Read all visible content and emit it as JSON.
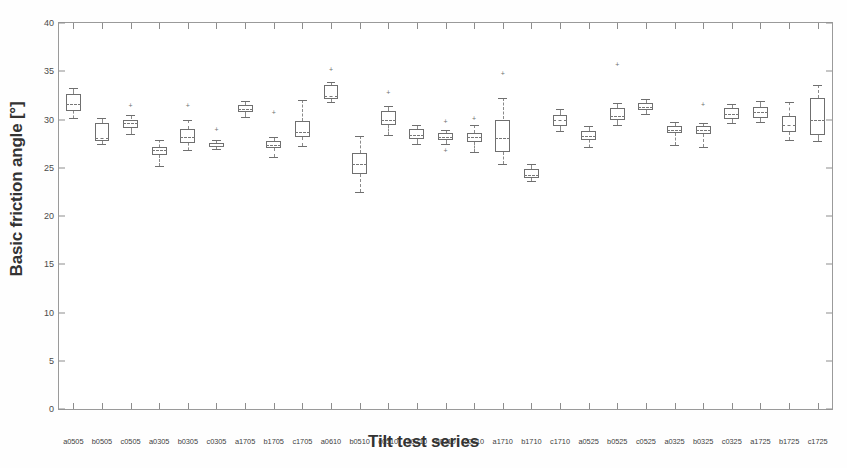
{
  "chart_data": {
    "type": "box",
    "title": "",
    "xlabel": "Tilt test series",
    "ylabel": "Basic friction angle [°]",
    "ylim": [
      0,
      40
    ],
    "ytick_labels": [
      "0",
      "5",
      "10",
      "15",
      "20",
      "25",
      "30",
      "35",
      "40"
    ],
    "yticks": [
      0,
      5,
      10,
      15,
      20,
      25,
      30,
      35,
      40
    ],
    "grid": false,
    "legend": null,
    "categories": [
      "a0505",
      "b0505",
      "c0505",
      "a0305",
      "b0305",
      "c0305",
      "a1705",
      "b1705",
      "c1705",
      "a0510",
      "b0510",
      "c0510",
      "a0310",
      "b0310",
      "c0310",
      "a1710",
      "b1710",
      "c1710",
      "a0525",
      "b0525",
      "c0525",
      "a0325",
      "b0325",
      "c0325",
      "a1725",
      "b1725",
      "c1725"
    ],
    "boxes": [
      {
        "label": "a0505",
        "whisker_low": 30.2,
        "q1": 30.9,
        "median": 31.6,
        "q3": 32.6,
        "whisker_high": 33.3,
        "outliers": []
      },
      {
        "label": "b0505",
        "whisker_low": 27.5,
        "q1": 27.8,
        "median": 28.1,
        "q3": 29.6,
        "whisker_high": 30.2,
        "outliers": []
      },
      {
        "label": "c0505",
        "whisker_low": 28.5,
        "q1": 29.1,
        "median": 29.6,
        "q3": 30.0,
        "whisker_high": 30.5,
        "outliers": [
          31.5
        ]
      },
      {
        "label": "a0305",
        "whisker_low": 25.2,
        "q1": 26.3,
        "median": 26.8,
        "q3": 27.2,
        "whisker_high": 27.9,
        "outliers": []
      },
      {
        "label": "b0305",
        "whisker_low": 26.8,
        "q1": 27.6,
        "median": 28.2,
        "q3": 29.0,
        "whisker_high": 29.9,
        "outliers": [
          31.5
        ]
      },
      {
        "label": "c0305",
        "whisker_low": 26.9,
        "q1": 27.1,
        "median": 27.3,
        "q3": 27.6,
        "whisker_high": 27.9,
        "outliers": [
          29.0
        ]
      },
      {
        "label": "a1705",
        "whisker_low": 30.3,
        "q1": 30.8,
        "median": 31.1,
        "q3": 31.5,
        "whisker_high": 31.9,
        "outliers": []
      },
      {
        "label": "b1705",
        "whisker_low": 26.1,
        "q1": 27.0,
        "median": 27.4,
        "q3": 27.8,
        "whisker_high": 28.2,
        "outliers": [
          30.8
        ]
      },
      {
        "label": "c1705",
        "whisker_low": 27.3,
        "q1": 28.2,
        "median": 28.7,
        "q3": 29.8,
        "whisker_high": 32.0,
        "outliers": []
      },
      {
        "label": "a0610",
        "whisker_low": 31.8,
        "q1": 32.1,
        "median": 32.4,
        "q3": 33.6,
        "whisker_high": 33.9,
        "outliers": [
          35.2
        ]
      },
      {
        "label": "b0510",
        "whisker_low": 22.5,
        "q1": 24.4,
        "median": 25.4,
        "q3": 26.5,
        "whisker_high": 28.3,
        "outliers": []
      },
      {
        "label": "c0510",
        "whisker_low": 28.4,
        "q1": 29.4,
        "median": 30.0,
        "q3": 30.9,
        "whisker_high": 31.4,
        "outliers": [
          32.8
        ]
      },
      {
        "label": "a0310",
        "whisker_low": 27.5,
        "q1": 28.0,
        "median": 28.4,
        "q3": 29.0,
        "whisker_high": 29.4,
        "outliers": []
      },
      {
        "label": "b0310",
        "whisker_low": 27.5,
        "q1": 27.9,
        "median": 28.2,
        "q3": 28.6,
        "whisker_high": 28.9,
        "outliers": [
          26.8,
          29.8
        ]
      },
      {
        "label": "c0310",
        "whisker_low": 26.6,
        "q1": 27.7,
        "median": 28.2,
        "q3": 28.6,
        "whisker_high": 29.4,
        "outliers": [
          30.2
        ]
      },
      {
        "label": "a1710",
        "whisker_low": 25.4,
        "q1": 26.6,
        "median": 28.1,
        "q3": 30.0,
        "whisker_high": 32.2,
        "outliers": [
          34.8
        ]
      },
      {
        "label": "b1710",
        "whisker_low": 23.6,
        "q1": 23.9,
        "median": 24.3,
        "q3": 24.9,
        "whisker_high": 25.4,
        "outliers": []
      },
      {
        "label": "c1710",
        "whisker_low": 28.8,
        "q1": 29.3,
        "median": 30.0,
        "q3": 30.5,
        "whisker_high": 31.1,
        "outliers": []
      },
      {
        "label": "a0525",
        "whisker_low": 27.1,
        "q1": 27.9,
        "median": 28.3,
        "q3": 28.8,
        "whisker_high": 29.3,
        "outliers": []
      },
      {
        "label": "b0525",
        "whisker_low": 29.4,
        "q1": 29.9,
        "median": 30.4,
        "q3": 31.2,
        "whisker_high": 31.7,
        "outliers": [
          35.8
        ]
      },
      {
        "label": "c0525",
        "whisker_low": 30.6,
        "q1": 31.0,
        "median": 31.3,
        "q3": 31.7,
        "whisker_high": 32.1,
        "outliers": []
      },
      {
        "label": "a0325",
        "whisker_low": 27.4,
        "q1": 28.6,
        "median": 28.9,
        "q3": 29.3,
        "whisker_high": 29.7,
        "outliers": []
      },
      {
        "label": "b0325",
        "whisker_low": 27.2,
        "q1": 28.5,
        "median": 28.9,
        "q3": 29.3,
        "whisker_high": 29.6,
        "outliers": [
          31.6
        ]
      },
      {
        "label": "c0325",
        "whisker_low": 29.6,
        "q1": 30.1,
        "median": 30.6,
        "q3": 31.2,
        "whisker_high": 31.6,
        "outliers": []
      },
      {
        "label": "a1725",
        "whisker_low": 29.7,
        "q1": 30.2,
        "median": 30.8,
        "q3": 31.3,
        "whisker_high": 31.9,
        "outliers": []
      },
      {
        "label": "b1725",
        "whisker_low": 27.9,
        "q1": 28.7,
        "median": 29.4,
        "q3": 30.4,
        "whisker_high": 31.8,
        "outliers": []
      },
      {
        "label": "c1725",
        "whisker_low": 27.8,
        "q1": 28.4,
        "median": 30.0,
        "q3": 32.2,
        "whisker_high": 33.6,
        "outliers": []
      }
    ],
    "colors": {
      "box_line": "#6f6f6f",
      "median_line": "#777777",
      "whisker_line": "#8a8a8a",
      "axis_line": "#9a9a9a",
      "text": "#333333",
      "background": "#ffffff"
    },
    "outlier_symbol": "+"
  }
}
